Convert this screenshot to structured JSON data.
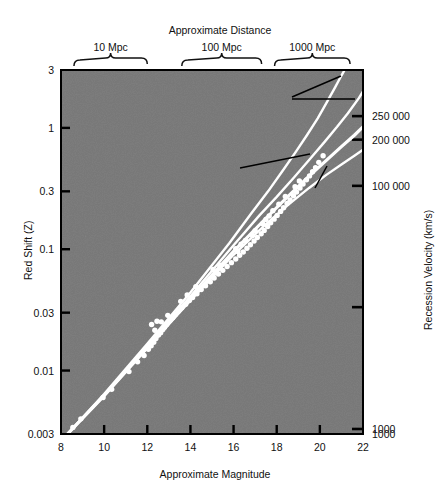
{
  "figure": {
    "top_axis_title": "Approximate Distance",
    "bottom_axis_title": "Approximate Magnitude",
    "left_axis_title": "Red Shift (Z)",
    "right_axis_title": "Recession Velocity (km/s)",
    "plot_background_color": "#787878",
    "data_color": "#ffffff",
    "axis_color": "#000000"
  },
  "distance_brackets": [
    {
      "label": "10 Mpc",
      "x_center_mag": 10.2
    },
    {
      "label": "100 Mpc",
      "x_center_mag": 15.2
    },
    {
      "label": "1000 Mpc",
      "x_center_mag": 19.2
    }
  ],
  "annotations": [
    {
      "name": "closed-universes",
      "line1": "Typical Closed Universes",
      "line2": "(various curvatures)"
    },
    {
      "name": "open-universe",
      "line1": "Open Universe"
    },
    {
      "name": "steady-state",
      "line1": "Steady",
      "line2": "State",
      "line3": "Universe"
    }
  ],
  "chart_data": {
    "type": "scatter",
    "title": "",
    "subtitle": "",
    "xlabel": "Approximate Magnitude",
    "ylabel": "Red Shift (Z)",
    "y2label": "Recession Velocity (km/s)",
    "x2label": "Approximate Distance",
    "grid": false,
    "legend": "none",
    "xlim": [
      8,
      22
    ],
    "xticks": [
      8,
      10,
      12,
      14,
      16,
      18,
      20,
      22
    ],
    "xticklabels": [
      "8",
      "10",
      "12",
      "14",
      "16",
      "18",
      "20",
      "22"
    ],
    "yscale": "log",
    "ylim": [
      0.003,
      3
    ],
    "yticks": [
      0.003,
      0.01,
      0.03,
      0.1,
      0.3,
      1,
      3
    ],
    "yticklabels": [
      "0.003",
      "0.01",
      "0.03",
      "0.1",
      "0.3",
      "1",
      "3"
    ],
    "y2ticks_labeled": [
      "1000",
      "100 000",
      "200 000",
      "250 000"
    ],
    "y2tick_values_z": [
      0.0033,
      0.333,
      0.8,
      1.25
    ],
    "y2tick_unlabeled_z": [
      0.0333
    ],
    "series": [
      {
        "name": "Galaxy observations",
        "type": "scatter",
        "marker": "filled-circle",
        "color": "#ffffff",
        "points": [
          [
            8.55,
            0.0034
          ],
          [
            8.92,
            0.004
          ],
          [
            9.95,
            0.006
          ],
          [
            10.35,
            0.007
          ],
          [
            11.15,
            0.0098
          ],
          [
            11.55,
            0.0118
          ],
          [
            11.85,
            0.0133
          ],
          [
            12.05,
            0.015
          ],
          [
            12.18,
            0.016
          ],
          [
            12.3,
            0.0171
          ],
          [
            12.4,
            0.0184
          ],
          [
            12.52,
            0.0196
          ],
          [
            12.62,
            0.0205
          ],
          [
            12.72,
            0.0218
          ],
          [
            12.8,
            0.0228
          ],
          [
            12.9,
            0.024
          ],
          [
            12.2,
            0.024
          ],
          [
            12.45,
            0.0255
          ],
          [
            13.05,
            0.0258
          ],
          [
            13.18,
            0.0272
          ],
          [
            13.3,
            0.029
          ],
          [
            13.45,
            0.031
          ],
          [
            13.6,
            0.033
          ],
          [
            13.78,
            0.0352
          ],
          [
            13.95,
            0.0378
          ],
          [
            14.1,
            0.04
          ],
          [
            14.3,
            0.043
          ],
          [
            14.5,
            0.0465
          ],
          [
            14.7,
            0.05
          ],
          [
            14.92,
            0.054
          ],
          [
            15.1,
            0.058
          ],
          [
            15.3,
            0.0625
          ],
          [
            15.5,
            0.067
          ],
          [
            15.7,
            0.072
          ],
          [
            15.9,
            0.0775
          ],
          [
            16.1,
            0.083
          ],
          [
            16.28,
            0.089
          ],
          [
            16.45,
            0.095
          ],
          [
            16.62,
            0.102
          ],
          [
            16.78,
            0.109
          ],
          [
            16.95,
            0.117
          ],
          [
            17.1,
            0.125
          ],
          [
            17.28,
            0.134
          ],
          [
            17.42,
            0.143
          ],
          [
            17.58,
            0.154
          ],
          [
            17.72,
            0.165
          ],
          [
            17.88,
            0.177
          ],
          [
            18.02,
            0.19
          ],
          [
            18.18,
            0.205
          ],
          [
            18.32,
            0.22
          ],
          [
            18.48,
            0.238
          ],
          [
            18.62,
            0.255
          ],
          [
            18.78,
            0.276
          ],
          [
            18.92,
            0.296
          ],
          [
            19.08,
            0.32
          ],
          [
            19.22,
            0.345
          ],
          [
            19.38,
            0.373
          ],
          [
            19.52,
            0.402
          ],
          [
            19.66,
            0.435
          ],
          [
            19.8,
            0.47
          ],
          [
            16.1,
            0.101
          ],
          [
            16.35,
            0.11
          ],
          [
            16.55,
            0.118
          ],
          [
            17.0,
            0.142
          ],
          [
            17.35,
            0.162
          ],
          [
            17.65,
            0.188
          ],
          [
            18.1,
            0.235
          ],
          [
            18.4,
            0.272
          ],
          [
            15.05,
            0.068
          ],
          [
            15.35,
            0.074
          ],
          [
            14.25,
            0.049
          ],
          [
            13.85,
            0.042
          ],
          [
            13.55,
            0.0372
          ],
          [
            12.95,
            0.0285
          ],
          [
            12.65,
            0.0252
          ],
          [
            12.35,
            0.0215
          ],
          [
            19.95,
            0.52
          ],
          [
            20.15,
            0.59
          ],
          [
            19.05,
            0.365
          ],
          [
            18.85,
            0.328
          ],
          [
            17.82,
            0.208
          ],
          [
            17.5,
            0.176
          ],
          [
            16.88,
            0.13
          ],
          [
            16.2,
            0.096
          ]
        ]
      },
      {
        "name": "Open Universe",
        "type": "line",
        "style": "solid",
        "width": 3.2,
        "color": "#ffffff",
        "points": [
          [
            8.3,
            0.003
          ],
          [
            10,
            0.0062
          ],
          [
            12,
            0.0155
          ],
          [
            14,
            0.039
          ],
          [
            16,
            0.096
          ],
          [
            17.5,
            0.18
          ],
          [
            18.5,
            0.27
          ],
          [
            19.5,
            0.4
          ],
          [
            20.3,
            0.54
          ],
          [
            21.0,
            0.7
          ],
          [
            21.6,
            0.87
          ],
          [
            22.0,
            1.02
          ]
        ]
      },
      {
        "name": "Steady State Universe",
        "type": "line",
        "style": "solid",
        "width": 2.4,
        "color": "#ffffff",
        "points": [
          [
            8.3,
            0.003
          ],
          [
            10,
            0.0062
          ],
          [
            12,
            0.0153
          ],
          [
            14,
            0.0378
          ],
          [
            16,
            0.09
          ],
          [
            17.5,
            0.161
          ],
          [
            18.5,
            0.23
          ],
          [
            19.5,
            0.32
          ],
          [
            20.3,
            0.41
          ],
          [
            21.0,
            0.5
          ],
          [
            21.6,
            0.59
          ],
          [
            22.0,
            0.66
          ]
        ]
      },
      {
        "name": "Typical Closed Universe A",
        "type": "line",
        "style": "solid",
        "width": 2.4,
        "color": "#ffffff",
        "points": [
          [
            8.3,
            0.003
          ],
          [
            10,
            0.0063
          ],
          [
            12,
            0.016
          ],
          [
            14,
            0.041
          ],
          [
            16,
            0.108
          ],
          [
            17.2,
            0.19
          ],
          [
            18.0,
            0.27
          ],
          [
            18.8,
            0.39
          ],
          [
            19.6,
            0.57
          ],
          [
            20.2,
            0.76
          ],
          [
            20.8,
            1.02
          ],
          [
            21.3,
            1.32
          ],
          [
            21.8,
            1.75
          ],
          [
            22.0,
            2.0
          ]
        ]
      },
      {
        "name": "Typical Closed Universe B",
        "type": "line",
        "style": "solid",
        "width": 2.4,
        "color": "#ffffff",
        "points": [
          [
            8.3,
            0.003
          ],
          [
            10,
            0.0064
          ],
          [
            12,
            0.0166
          ],
          [
            14,
            0.044
          ],
          [
            15.8,
            0.112
          ],
          [
            16.8,
            0.195
          ],
          [
            17.6,
            0.3
          ],
          [
            18.3,
            0.45
          ],
          [
            18.9,
            0.64
          ],
          [
            19.4,
            0.87
          ],
          [
            19.9,
            1.2
          ],
          [
            20.3,
            1.6
          ],
          [
            20.7,
            2.15
          ],
          [
            21.0,
            2.7
          ],
          [
            21.15,
            3.0
          ]
        ]
      }
    ]
  }
}
